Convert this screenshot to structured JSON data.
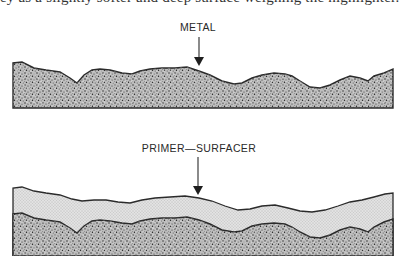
{
  "caption_fragment": "ey as a slightly softer and deep surface weighing the highlighter.",
  "figures": [
    {
      "id": "bare-metal",
      "label": "METAL",
      "layers": [
        "metal"
      ]
    },
    {
      "id": "primed-metal",
      "label": "PRIMER—SURFACER",
      "layers": [
        "primer-surfacer",
        "metal"
      ]
    }
  ],
  "colors": {
    "outline": "#2b2b2b",
    "metal_fill": "#9a9a9a",
    "primer_fill": "#d6d6d6",
    "background": "#ffffff"
  }
}
